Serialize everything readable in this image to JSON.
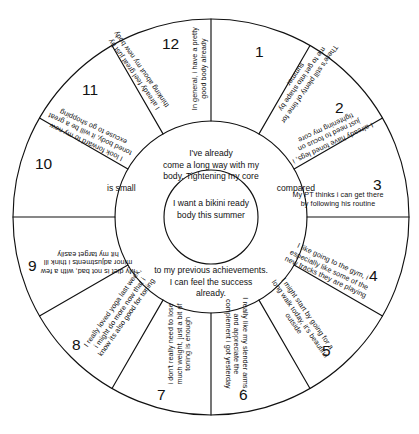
{
  "diagram": {
    "type": "segmented-wheel",
    "segment_count": 12,
    "colors": {
      "stroke": "#111111",
      "background": "#ffffff",
      "text": "#111111"
    },
    "core": {
      "text": "I want a bikini ready body this summer"
    },
    "ring": {
      "top_text": "I've already come a long way with my body. Tightening my core is small                    compared",
      "top_line1": "I've already",
      "top_line2": "come a long way with my",
      "top_line3": "body. Tightening my core",
      "top_line4_left": "is small",
      "top_line4_right": "compared",
      "bottom_line1": "to my previous achievements.",
      "bottom_line2": "I can feel the success",
      "bottom_line3": "already."
    },
    "segments": [
      {
        "number": "1",
        "text": "There's still plenty of time for me to get into shape by summer"
      },
      {
        "number": "2",
        "text": "I already have toned legs, i just need to focus on tightening my core"
      },
      {
        "number": "3",
        "text": "My PT thinks i can get there by following his routine"
      },
      {
        "number": "4",
        "text": "I like going to the gym, i especially like some of the new tracks they are playing"
      },
      {
        "number": "5",
        "text": "I might start by going for a long walk today, it's beautiful outside"
      },
      {
        "number": "6",
        "text": "I really like my slender arms, and appreciate the complement i got yesterday"
      },
      {
        "number": "7",
        "text": "i don't really need to lose much weight, just a bit of toning is enough"
      },
      {
        "number": "8",
        "text": "I really loved yoga last week, i might do more now that i know its also good for toning"
      },
      {
        "number": "9",
        "text": "My diet is not bad, with a few minor adjustments i think ill hit my target easily"
      },
      {
        "number": "10",
        "text": "I look forward to my new toned body, it will be a great excuse to go shopping"
      },
      {
        "number": "11",
        "text": "I already feel great just by thinking about my new body"
      },
      {
        "number": "12",
        "text": "In general, i have a pretty good body already"
      }
    ]
  }
}
